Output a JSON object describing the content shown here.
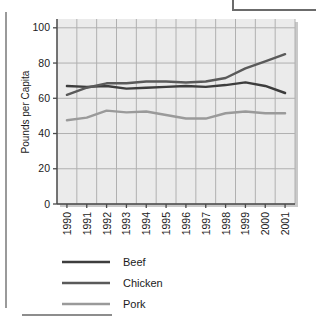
{
  "chart_data": {
    "type": "line",
    "title": "",
    "xlabel": "",
    "ylabel": "Pounds per Capita",
    "categories": [
      "1990",
      "1991",
      "1992",
      "1993",
      "1994",
      "1995",
      "1996",
      "1997",
      "1998",
      "1999",
      "2000",
      "2001"
    ],
    "x": [
      1990,
      1991,
      1992,
      1993,
      1994,
      1995,
      1996,
      1997,
      1998,
      1999,
      2000,
      2001
    ],
    "ylim": [
      0,
      105
    ],
    "yticks": [
      0,
      20,
      40,
      60,
      80,
      100
    ],
    "ytick_labels": [
      "0",
      "20",
      "40",
      "60",
      "80",
      "100"
    ],
    "grid": true,
    "legend_position": "below-left",
    "series": [
      {
        "name": "Beef",
        "color": "#3d3d3d",
        "values": [
          67.0,
          66.5,
          67.0,
          65.5,
          66.0,
          66.5,
          67.0,
          66.5,
          67.5,
          69.0,
          67.0,
          63.0
        ]
      },
      {
        "name": "Chicken",
        "color": "#5a5a5a",
        "values": [
          62.0,
          66.0,
          68.5,
          68.5,
          69.5,
          69.5,
          69.0,
          69.5,
          71.5,
          77.0,
          81.0,
          85.0
        ]
      },
      {
        "name": "Pork",
        "color": "#9a9a9a",
        "values": [
          47.5,
          49.0,
          53.0,
          52.0,
          52.5,
          50.5,
          48.5,
          48.5,
          51.5,
          52.5,
          51.5,
          51.5
        ]
      }
    ]
  },
  "axis": {
    "y_label": "Pounds per Capita",
    "y_ticks": [
      "100",
      "80",
      "60",
      "40",
      "20",
      "0"
    ],
    "x_ticks": [
      "1990",
      "1991",
      "1992",
      "1993",
      "1994",
      "1995",
      "1996",
      "1997",
      "1998",
      "1999",
      "2000",
      "2001"
    ]
  },
  "legend": {
    "items": [
      {
        "label": "Beef",
        "color": "#3d3d3d"
      },
      {
        "label": "Chicken",
        "color": "#5a5a5a"
      },
      {
        "label": "Pork",
        "color": "#9a9a9a"
      }
    ]
  },
  "style": {
    "plot_background": "#ebebeb",
    "grid_color": "#b0b0b0",
    "axis_color": "#4a4a4a",
    "text_color": "#1b1b1b"
  }
}
